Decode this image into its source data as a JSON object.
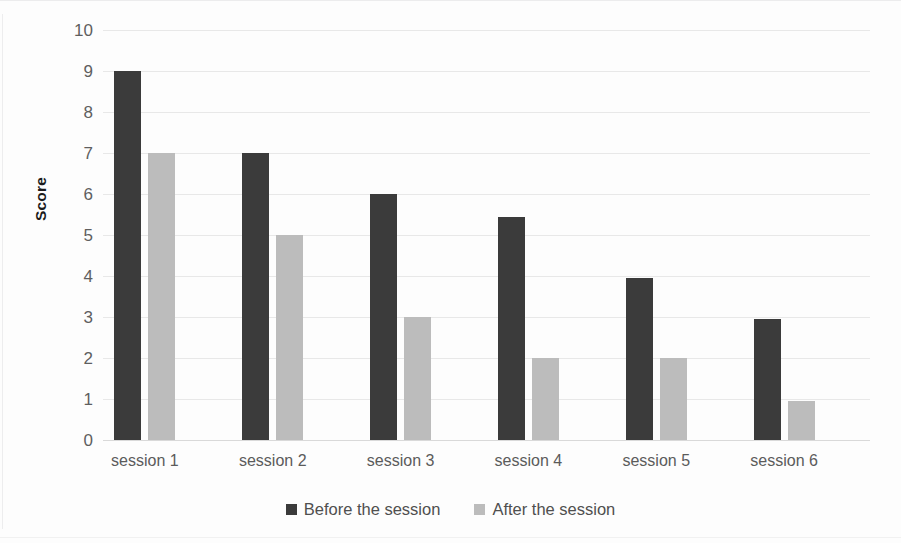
{
  "chart_data": {
    "type": "bar",
    "title": "",
    "subtitle": "",
    "xlabel": "",
    "ylabel": "Score",
    "categories": [
      "session 1",
      "session 2",
      "session 3",
      "session 4",
      "session 5",
      "session 6"
    ],
    "series": [
      {
        "name": "Before the session",
        "color": "#3b3b3b",
        "values": [
          9,
          7,
          6,
          5.45,
          3.95,
          2.95
        ]
      },
      {
        "name": "After the session",
        "color": "#bcbcbc",
        "values": [
          7,
          5,
          3,
          2,
          2,
          0.95
        ]
      }
    ],
    "ylim": [
      0,
      10
    ],
    "ytick_values": [
      0,
      1,
      2,
      3,
      4,
      5,
      6,
      7,
      8,
      9,
      10
    ],
    "ytick_labels": [
      "0",
      "1",
      "2",
      "3",
      "4",
      "5",
      "6",
      "7",
      "8",
      "9",
      "10"
    ],
    "grid": true,
    "grid_axis": "y",
    "legend": true,
    "legend_position": "bottom"
  },
  "axes": {
    "y_title": "Score"
  },
  "legend": {
    "entries": [
      {
        "label": "Before the session",
        "swatch": "#3b3b3b"
      },
      {
        "label": "After the session",
        "swatch": "#bcbcbc"
      }
    ]
  },
  "colors": {
    "before": "#3b3b3b",
    "after": "#bcbcbc",
    "gridline": "#e8e8e8",
    "axis": "#d9d9d9",
    "tick_text": "#5f5f5f",
    "background": "#fdfdfd"
  }
}
